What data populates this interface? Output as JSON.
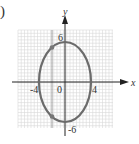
{
  "part_label": ")",
  "chart_data": {
    "type": "line",
    "title": "",
    "xlabel": "x",
    "ylabel": "y",
    "curve": "ellipse",
    "equation": "x^2/16 + y^2/36 = 1",
    "center": [
      0,
      0
    ],
    "semi_axis_x": 4,
    "semi_axis_y": 6,
    "xlim": [
      -7,
      7
    ],
    "ylim": [
      -7,
      7
    ],
    "grid": true,
    "x_tick_labels": [
      "-4",
      "0",
      "4"
    ],
    "y_tick_labels": [
      "6",
      "-6"
    ],
    "highlighted_points": [
      [
        -2,
        5.2
      ],
      [
        -2,
        -5.2
      ]
    ],
    "vertical_reference_line_x": -2,
    "colors": {
      "curve": "#6b6b6b",
      "grid": "#d8d8d8",
      "axes": "#222222",
      "points": "#777777"
    }
  }
}
